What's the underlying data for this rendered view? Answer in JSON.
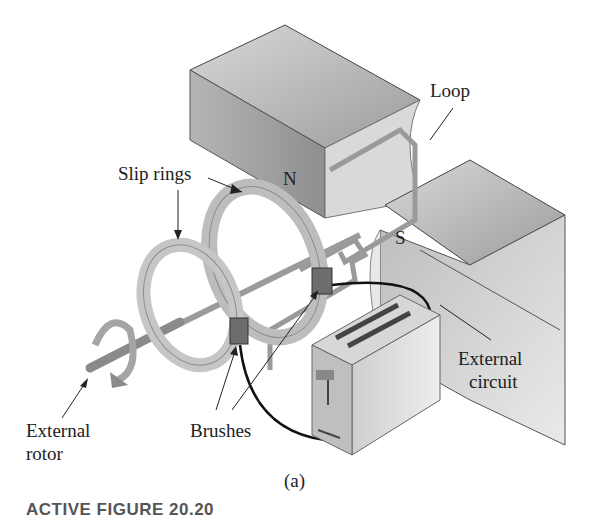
{
  "figure": {
    "panel_label": "(a)",
    "caption_title": "ACTIVE FIGURE 20.20",
    "labels": {
      "loop": "Loop",
      "slip_rings": "Slip rings",
      "north_pole": "N",
      "south_pole": "S",
      "external_rotor_line1": "External",
      "external_rotor_line2": "rotor",
      "brushes": "Brushes",
      "external_circuit_line1": "External",
      "external_circuit_line2": "circuit"
    },
    "colors": {
      "magnet_light": "#e6e6e6",
      "magnet_dark": "#a8a8a8",
      "ring": "#c8c8c8",
      "wire": "#111111",
      "brush": "#6d6d6d"
    }
  }
}
